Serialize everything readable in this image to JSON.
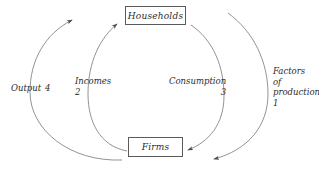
{
  "diagram": {
    "background_color": "#ffffff",
    "stroke_color": "#6b6b6b",
    "text_color": "#2b2b2b",
    "nodes": [
      {
        "id": "households",
        "label": "Households"
      },
      {
        "id": "firms",
        "label": "Firms"
      }
    ],
    "flows": [
      {
        "id": "factors-of-production",
        "label_line1": "Factors",
        "label_line2": "of",
        "label_line3": "production",
        "number": "1",
        "from": "Households",
        "to": "Firms",
        "side": "outer-right"
      },
      {
        "id": "incomes",
        "label": "Incomes",
        "number": "2",
        "from": "Firms",
        "to": "Households",
        "side": "inner-left"
      },
      {
        "id": "consumption",
        "label": "Consumption",
        "number": "3",
        "from": "Households",
        "to": "Firms",
        "side": "inner-right"
      },
      {
        "id": "output",
        "label": "Output",
        "number": "4",
        "from": "Firms",
        "to": "Households",
        "side": "outer-left"
      }
    ]
  }
}
